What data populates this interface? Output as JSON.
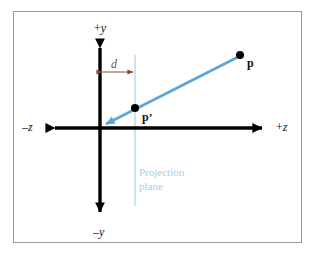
{
  "figure": {
    "kind": "perspective-projection-diagram",
    "background_color": "#ffffff",
    "border_color": "#9a9a9a"
  },
  "axes": {
    "color": "#000000",
    "vertical": {
      "positive_label_sign": "+",
      "positive_label_axis": "y",
      "negative_label_sign": "–",
      "negative_label_axis": "y",
      "x": 100,
      "top_y": 38,
      "bottom_y": 222
    },
    "horizontal": {
      "positive_label_sign": "+",
      "positive_label_axis": "z",
      "negative_label_sign": "–",
      "negative_label_axis": "z",
      "y": 128,
      "left_x": 44,
      "right_x": 272
    },
    "origin": {
      "x": 100,
      "y": 128
    }
  },
  "projection_plane": {
    "label_line1": "Projection",
    "label_line2": "plane",
    "color": "#a8cfe4",
    "x": 135,
    "top_y": 55,
    "bottom_y": 206,
    "label_x": 139,
    "label_y": 166
  },
  "dimension": {
    "label": "d",
    "color": "#8a4a3a",
    "from_x": 100,
    "to_x": 135,
    "y": 72,
    "label_x": 111,
    "label_y": 58
  },
  "ray": {
    "color": "#5ba6d4",
    "from_x": 240,
    "from_y": 56,
    "to_x": 101,
    "to_y": 127,
    "arrow_at": "origin"
  },
  "points": [
    {
      "name": "p",
      "label": "p",
      "prime": "",
      "dot_x": 240,
      "dot_y": 55,
      "dot_r": 4,
      "label_x": 247,
      "label_y": 57,
      "color": "#000000"
    },
    {
      "name": "p-prime",
      "label": "p",
      "prime": "’",
      "dot_x": 135,
      "dot_y": 108,
      "dot_r": 4,
      "label_x": 142,
      "label_y": 111,
      "color": "#000000"
    }
  ],
  "labels": {
    "plus_y_x": 94,
    "plus_y_y": 22,
    "minus_y_x": 93,
    "minus_y_y": 226,
    "minus_z_x": 22,
    "minus_z_y": 121,
    "plus_z_x": 276,
    "plus_z_y": 121
  }
}
